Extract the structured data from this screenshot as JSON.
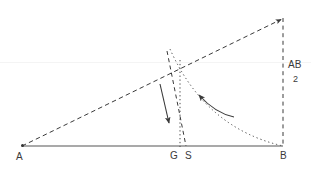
{
  "diagram": {
    "background_color": "#ffffff",
    "stroke_color": "#3a3a3a",
    "baseline_color": "#555555",
    "points": [
      {
        "id": "A",
        "label": "A",
        "x": 22,
        "y": 146
      },
      {
        "id": "G",
        "label": "G",
        "x": 177,
        "y": 146
      },
      {
        "id": "S",
        "label": "S",
        "x": 186,
        "y": 146
      },
      {
        "id": "B",
        "label": "B",
        "x": 283,
        "y": 146
      },
      {
        "id": "T",
        "label": "",
        "x": 283,
        "y": 18
      }
    ],
    "segments": [
      {
        "name": "baseline-AB",
        "style": "solid",
        "from": {
          "x": 22,
          "y": 146
        },
        "to": {
          "x": 283,
          "y": 146
        }
      },
      {
        "name": "hypotenuse-A-to-apex",
        "style": "dashed",
        "from": {
          "x": 22,
          "y": 146
        },
        "to": {
          "x": 283,
          "y": 18
        }
      },
      {
        "name": "vertical-apex-to-B",
        "style": "dashed",
        "from": {
          "x": 283,
          "y": 18
        },
        "to": {
          "x": 283,
          "y": 146
        }
      },
      {
        "name": "perpendicular-bisector-through-S",
        "style": "dashed",
        "from": {
          "x": 167,
          "y": 51
        },
        "to": {
          "x": 186,
          "y": 146
        }
      },
      {
        "name": "vertical-drop-at-G",
        "style": "dotted",
        "from": {
          "x": 180,
          "y": 60
        },
        "to": {
          "x": 180,
          "y": 146
        }
      }
    ],
    "arcs": [
      {
        "name": "construction-arc",
        "style": "dotted",
        "from": {
          "x": 170,
          "y": 49
        },
        "to": {
          "x": 283,
          "y": 146
        },
        "control": {
          "x": 205,
          "y": 128
        }
      }
    ],
    "arrows": [
      {
        "name": "downward-motion-arrow",
        "style": "solid",
        "curved": false,
        "from": {
          "x": 160,
          "y": 84
        },
        "to": {
          "x": 169,
          "y": 124
        }
      },
      {
        "name": "inward-motion-arrow",
        "style": "solid",
        "curved": true,
        "from": {
          "x": 234,
          "y": 117
        },
        "control": {
          "x": 216,
          "y": 114
        },
        "to": {
          "x": 198,
          "y": 94
        }
      }
    ],
    "annotations": {
      "fraction": {
        "name": "half-AB-label",
        "numerator": "AB",
        "denominator": "2"
      }
    }
  }
}
